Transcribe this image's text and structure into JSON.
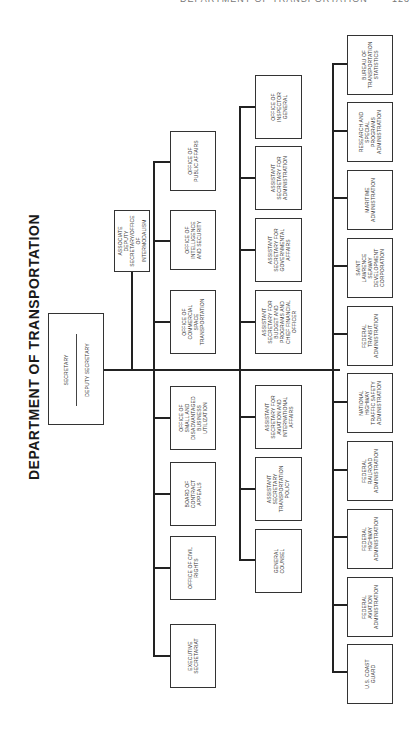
{
  "running_header": {
    "text": "DEPARTMENT OF TRANSPORTATION",
    "page": "123"
  },
  "title": "DEPARTMENT OF TRANSPORTATION",
  "top": {
    "secretary": "SECRETARY",
    "deputy_secretary": "DEPUTY SECRETARY",
    "associate_deputy": "ASSOCIATE DEPUTY SECRETARY/OFFICE OF INTERMODALISM"
  },
  "staff_offices": [
    "OFFICE OF PUBLIC AFFAIRS",
    "OFFICE OF INTELLIGENCE AND SECURITY",
    "OFFICE OF COMMERCIAL SPACE TRANSPORTATION",
    "OFFICE OF SMALL AND DISADVANTAGED BUSINESS UTILIZATION",
    "BOARD OF CONTRACT APPEALS",
    "OFFICE OF CIVIL RIGHTS",
    "EXECUTIVE SECRETARIAT"
  ],
  "secretarial_offices": [
    "OFFICE OF INSPECTOR GENERAL",
    "ASSISTANT SECRETARY FOR ADMINISTRATION",
    "ASSISTANT SECRETARY FOR GOVERNMENTAL AFFAIRS",
    "ASSISTANT SECRETARY FOR BUDGET AND PROGRAMS AND CHIEF FINANCIAL OFFICER",
    "ASSISTANT SECRETARY FOR AVIATION AND INTERNATIONAL AFFAIRS",
    "ASSISTANT SECRETARY TRANSPORTATION POLICY",
    "GENERAL COUNSEL"
  ],
  "operating_administrations": [
    "BUREAU OF TRANSPORTATION STATISTICS",
    "RESEARCH AND SPECIAL PROGRAMS ADMINISTRATION",
    "MARITIME ADMINISTRATION",
    "SAINT LAWRENCE SEAWAY DEVELOPMENT CORPORATION",
    "FEDERAL TRANSIT ADMINISTRATION",
    "NATIONAL HIGHWAY TRAFFIC SAFETY ADMINISTRATION",
    "FEDERAL RAILROAD ADMINISTRATION",
    "FEDERAL HIGHWAY ADMINISTRATION",
    "FEDERAL AVIATION ADMINISTRATION",
    "U.S. COAST GUARD"
  ]
}
